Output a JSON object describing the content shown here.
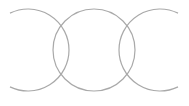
{
  "diagram": {
    "type": "three-overlapping-circles",
    "stroke_color": "#a9a9a9",
    "background_color": "#ffffff",
    "radius": 41,
    "center_y": 50,
    "circles": [
      {
        "name": "left",
        "cx": 28,
        "open_side": "left"
      },
      {
        "name": "middle",
        "cx": 94,
        "open_side": "none"
      },
      {
        "name": "right",
        "cx": 160,
        "open_side": "right"
      }
    ]
  }
}
